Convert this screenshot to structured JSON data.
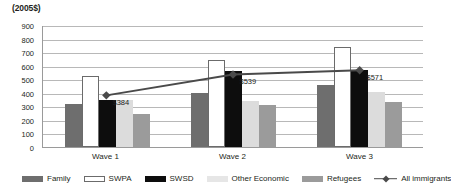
{
  "chart_data": {
    "type": "bar",
    "title": "(2005$)",
    "xlabel": "",
    "ylabel": "(2005$)",
    "ylim": [
      0,
      900
    ],
    "ytick_step": 100,
    "yticks": [
      900,
      800,
      700,
      600,
      500,
      400,
      300,
      200,
      100,
      0
    ],
    "grid": true,
    "legend_position": "bottom",
    "categories": [
      "Wave 1",
      "Wave 2",
      "Wave 3"
    ],
    "series": [
      {
        "name": "Family",
        "type": "bar",
        "color": "#6e6e6e",
        "values": [
          315,
          400,
          455
        ]
      },
      {
        "name": "SWPA",
        "type": "bar",
        "color": "#ffffff",
        "values": [
          525,
          640,
          740
        ]
      },
      {
        "name": "SWSD",
        "type": "bar",
        "color": "#0d0d0d",
        "values": [
          350,
          560,
          570
        ]
      },
      {
        "name": "Other Economic",
        "type": "bar",
        "color": "#dcdcdc",
        "values": [
          350,
          340,
          405
        ]
      },
      {
        "name": "Refugees",
        "type": "bar",
        "color": "#9b9b9b",
        "values": [
          240,
          310,
          330
        ]
      },
      {
        "name": "All immigrants",
        "type": "line",
        "color": "#4a4a4a",
        "values": [
          384,
          539,
          571
        ],
        "point_labels": [
          "$384",
          "$539",
          "$571"
        ]
      }
    ]
  },
  "legend": {
    "items": [
      {
        "label": "Family",
        "swatch": "family"
      },
      {
        "label": "SWPA",
        "swatch": "swpa"
      },
      {
        "label": "SWSD",
        "swatch": "swsd"
      },
      {
        "label": "Other Economic",
        "swatch": "other"
      },
      {
        "label": "Refugees",
        "swatch": "refugees"
      },
      {
        "label": "All immigrants",
        "swatch": "line"
      }
    ]
  }
}
